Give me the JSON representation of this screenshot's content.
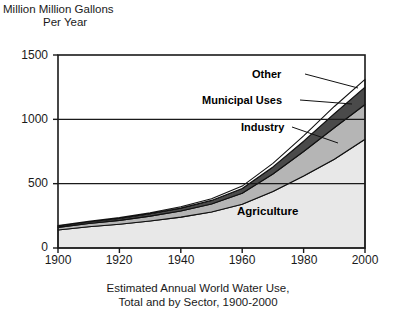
{
  "figure": {
    "y_axis_title_line1": "Million Million Gallons",
    "y_axis_title_line2": "Per Year",
    "caption_line1": "Estimated Annual World Water Use,",
    "caption_line2": "Total and by Sector, 1900-2000"
  },
  "callouts": {
    "other": "Other",
    "municipal": "Municipal Uses",
    "industry": "Industry",
    "agriculture": "Agriculture"
  },
  "colors": {
    "agriculture": "#e8e8e8",
    "industry": "#b5b5b5",
    "municipal": "#4a4a4a",
    "other": "#ffffff",
    "axis": "#1a1a1a",
    "background": "#ffffff"
  },
  "chart_data": {
    "type": "area",
    "xlabel": "",
    "ylabel": "Million Million Gallons Per Year",
    "stacked": true,
    "grid": true,
    "legend_position": "callout-lines",
    "xlim": [
      1900,
      2000
    ],
    "ylim": [
      0,
      1500
    ],
    "xticks": [
      1900,
      1920,
      1940,
      1960,
      1980,
      2000
    ],
    "yticks": [
      0,
      500,
      1000,
      1500
    ],
    "x": [
      1900,
      1910,
      1920,
      1930,
      1940,
      1950,
      1960,
      1970,
      1980,
      1990,
      2000
    ],
    "series": [
      {
        "name": "Agriculture",
        "values": [
          140,
          165,
          185,
          210,
          240,
          280,
          340,
          440,
          560,
          690,
          845
        ]
      },
      {
        "name": "Industry",
        "values": [
          20,
          25,
          30,
          38,
          48,
          62,
          85,
          135,
          190,
          245,
          270
        ]
      },
      {
        "name": "Municipal Uses",
        "values": [
          10,
          12,
          15,
          18,
          22,
          28,
          38,
          55,
          80,
          110,
          135
        ]
      },
      {
        "name": "Other",
        "values": [
          5,
          6,
          7,
          8,
          10,
          13,
          18,
          28,
          42,
          55,
          60
        ]
      }
    ],
    "totals": [
      175,
      208,
      237,
      274,
      320,
      383,
      481,
      658,
      872,
      1100,
      1310
    ]
  }
}
